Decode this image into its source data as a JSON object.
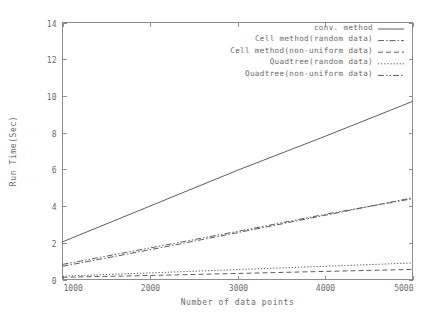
{
  "chart_data": {
    "type": "line",
    "title": "",
    "xlabel": "Number of data points",
    "ylabel": "Run Time(Sec)",
    "xlim": [
      1000,
      5000
    ],
    "ylim": [
      0,
      14
    ],
    "xticks": [
      "1000",
      "2000",
      "3000",
      "4000",
      "5000"
    ],
    "xtick_values": [
      1000,
      2000,
      3000,
      4000,
      5000
    ],
    "yticks": [
      "0",
      "2",
      "4",
      "6",
      "8",
      "10",
      "12",
      "14"
    ],
    "ytick_values": [
      0,
      2,
      4,
      6,
      8,
      10,
      12,
      14
    ],
    "grid": false,
    "legend_position": "top-right",
    "x": [
      1000,
      2000,
      3000,
      4000,
      5000
    ],
    "series": [
      {
        "name": "conv. method",
        "dash": "solid",
        "values": [
          2.05,
          4.0,
          5.95,
          7.8,
          9.7
        ]
      },
      {
        "name": "Cell method(random data)",
        "dash": "dash-dot",
        "values": [
          0.72,
          1.62,
          2.55,
          3.5,
          4.45
        ]
      },
      {
        "name": "Cell method(non-uniform data)",
        "dash": "dashed",
        "values": [
          0.12,
          0.22,
          0.33,
          0.44,
          0.55
        ]
      },
      {
        "name": "Quadtree(random data)",
        "dash": "dotted",
        "values": [
          0.18,
          0.36,
          0.54,
          0.72,
          0.9
        ]
      },
      {
        "name": "Quadtree(non-uniform data)",
        "dash": "dash-dot-dot",
        "values": [
          0.82,
          1.72,
          2.62,
          3.55,
          4.4
        ]
      }
    ]
  },
  "colors": {
    "line": "#5e5e5e",
    "axis": "#8c8c8c",
    "text": "#6a6a6a",
    "background": "#ffffff"
  }
}
